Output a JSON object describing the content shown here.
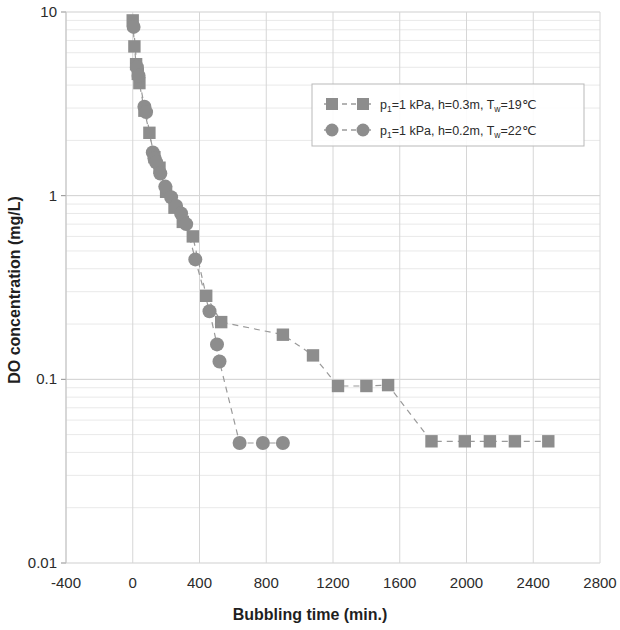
{
  "chart_data": {
    "type": "scatter",
    "title": "",
    "xlabel": "Bubbling time (min.)",
    "ylabel": "DO concentration (mg/L)",
    "xlim": [
      -400,
      2800
    ],
    "ylim": [
      0.01,
      10
    ],
    "yscale": "log",
    "xticks": [
      "-400",
      "0",
      "400",
      "800",
      "1200",
      "1600",
      "2000",
      "2400",
      "2800"
    ],
    "xtick_values": [
      -400,
      0,
      400,
      800,
      1200,
      1600,
      2000,
      2400,
      2800
    ],
    "yticks": [
      "10",
      "1",
      "0.1",
      "0.01"
    ],
    "ytick_values": [
      10,
      1,
      0.1,
      0.01
    ],
    "grid": true,
    "legend_position": "upper right",
    "marker_color": "#8d8d8d",
    "line_color": "#9a9a9a",
    "series": [
      {
        "name": "p₁=1 kPa, h=0.3m, T_w=19℃",
        "marker": "square",
        "color": "#8d8d8d",
        "points": [
          [
            0,
            9.0
          ],
          [
            10,
            6.5
          ],
          [
            20,
            5.2
          ],
          [
            30,
            4.6
          ],
          [
            40,
            4.1
          ],
          [
            70,
            2.9
          ],
          [
            100,
            2.2
          ],
          [
            130,
            1.62
          ],
          [
            160,
            1.42
          ],
          [
            200,
            1.05
          ],
          [
            250,
            0.86
          ],
          [
            300,
            0.72
          ],
          [
            360,
            0.6
          ],
          [
            440,
            0.285
          ],
          [
            530,
            0.205
          ],
          [
            900,
            0.175
          ],
          [
            1080,
            0.135
          ],
          [
            1230,
            0.092
          ],
          [
            1400,
            0.092
          ],
          [
            1530,
            0.093
          ],
          [
            1790,
            0.046
          ],
          [
            1990,
            0.046
          ],
          [
            2140,
            0.046
          ],
          [
            2290,
            0.046
          ],
          [
            2490,
            0.046
          ]
        ]
      },
      {
        "name": "p₁=1 kPa, h=0.2m, T_w=22℃",
        "marker": "circle",
        "color": "#8d8d8d",
        "points": [
          [
            5,
            8.3
          ],
          [
            25,
            5.0
          ],
          [
            35,
            4.5
          ],
          [
            70,
            3.05
          ],
          [
            80,
            2.85
          ],
          [
            120,
            1.72
          ],
          [
            130,
            1.6
          ],
          [
            140,
            1.52
          ],
          [
            165,
            1.32
          ],
          [
            195,
            1.12
          ],
          [
            230,
            0.98
          ],
          [
            260,
            0.88
          ],
          [
            290,
            0.8
          ],
          [
            320,
            0.7
          ],
          [
            375,
            0.45
          ],
          [
            460,
            0.235
          ],
          [
            505,
            0.155
          ],
          [
            520,
            0.125
          ],
          [
            640,
            0.045
          ],
          [
            780,
            0.045
          ],
          [
            900,
            0.045
          ]
        ]
      }
    ],
    "legend": [
      {
        "marker": "square",
        "parts": {
          "p": "p",
          "p_sub": "1",
          "mid": "=1 kPa, h=0.3m, T",
          "t_sub": "w",
          "tail": "=19℃"
        },
        "full_label": "p₁=1 kPa, h=0.3m, T_w=19℃"
      },
      {
        "marker": "circle",
        "parts": {
          "p": "p",
          "p_sub": "1",
          "mid": "=1 kPa, h=0.2m, T",
          "t_sub": "w",
          "tail": "=22℃"
        },
        "full_label": "p₁=1 kPa, h=0.2m, T_w=22℃"
      }
    ]
  }
}
